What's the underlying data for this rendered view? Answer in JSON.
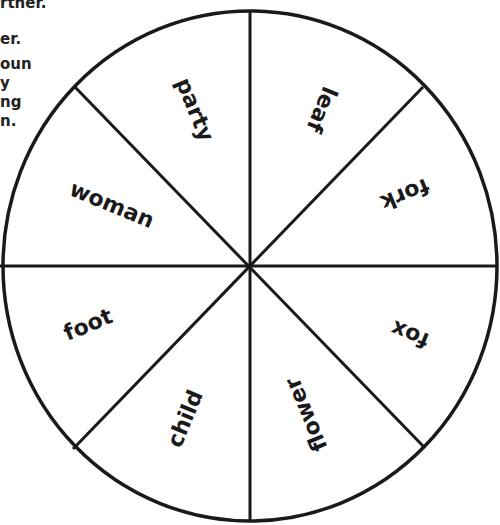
{
  "instructions_fragment": {
    "lines": [
      "rther.",
      "er.",
      "oun",
      "y",
      "ng",
      "n."
    ]
  },
  "wheel": {
    "stroke_color": "#1a1a1a",
    "segments": [
      {
        "label": "party"
      },
      {
        "label": "leaf"
      },
      {
        "label": "fork"
      },
      {
        "label": "fox"
      },
      {
        "label": "flower"
      },
      {
        "label": "child"
      },
      {
        "label": "foot"
      },
      {
        "label": "woman"
      }
    ]
  }
}
